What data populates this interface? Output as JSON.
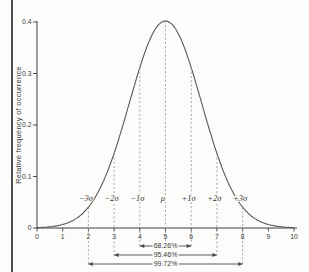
{
  "chart_data": {
    "type": "line",
    "title": "",
    "xlabel": "",
    "ylabel": "Relative frequency of occurrence",
    "xlim": [
      0,
      10
    ],
    "ylim": [
      0,
      0.4
    ],
    "x_ticks": [
      "0",
      "1",
      "2",
      "3",
      "4",
      "5",
      "6",
      "7",
      "8",
      "9",
      "10"
    ],
    "y_ticks": [
      "0",
      "0.1",
      "0.2",
      "0.3",
      "0.4"
    ],
    "grid": false,
    "legend": false,
    "distribution": "normal",
    "mean": 5,
    "sigma": 1,
    "peak_density": 0.4,
    "x": [
      0,
      1,
      2,
      3,
      4,
      5,
      6,
      7,
      8,
      9,
      10
    ],
    "y": [
      0.0,
      0.001,
      0.004,
      0.054,
      0.242,
      0.399,
      0.242,
      0.054,
      0.004,
      0.001,
      0.0
    ],
    "sigma_markers": [
      {
        "label": "−3σ",
        "x": 2
      },
      {
        "label": "−2σ",
        "x": 3
      },
      {
        "label": "−1σ",
        "x": 4
      },
      {
        "label": "μ",
        "x": 5
      },
      {
        "label": "+1σ",
        "x": 6
      },
      {
        "label": "+2σ",
        "x": 7
      },
      {
        "label": "+3σ",
        "x": 8
      }
    ],
    "coverage_brackets": [
      {
        "label": "68.26%",
        "from_x": 4,
        "to_x": 6
      },
      {
        "label": "95.46%",
        "from_x": 3,
        "to_x": 7
      },
      {
        "label": "99.72%",
        "from_x": 2,
        "to_x": 8
      }
    ]
  }
}
